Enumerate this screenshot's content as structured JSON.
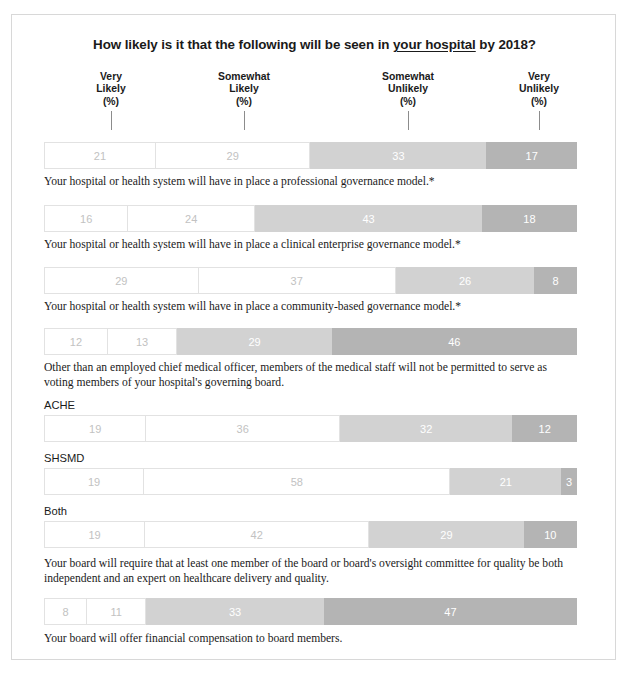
{
  "title": {
    "part1": "How likely is it that the following will be seen in ",
    "emphasis": "your hospital",
    "part2": " by 2018?"
  },
  "column_headers": [
    {
      "line1": "Very",
      "line2": "Likely",
      "line3": "(%)"
    },
    {
      "line1": "Somewhat",
      "line2": "Likely",
      "line3": "(%)"
    },
    {
      "line1": "Somewhat",
      "line2": "Unlikely",
      "line3": "(%)"
    },
    {
      "line1": "Very",
      "line2": "Unlikely",
      "line3": "(%)"
    }
  ],
  "series_labels": {
    "ache": "ACHE",
    "shsmd": "SHSMD",
    "both": "Both"
  },
  "captions": {
    "c1": "Your hospital or health system will have in place a professional governance model.*",
    "c2": "Your hospital or health system will have in place a clinical enterprise governance model.*",
    "c3": "Your hospital or health system will have in place a community-based governance model.*",
    "c4": "Other than an employed chief medical officer, members of the medical staff will not be permitted to serve as voting members of your hospital's governing board.",
    "c5": "Your board will require that at least one member of the board or board's oversight committee for quality be both independent and an expert on healthcare delivery and quality.",
    "c6": "Your board will offer financial compensation to board members."
  },
  "colors": {
    "very_likely": "#ffffff",
    "somewhat_likely": "#ffffff",
    "somewhat_unlikely": "#d2d2d2",
    "very_unlikely": "#b4b4b4",
    "segment_border": "#e2e2e2",
    "light_text": "#c2c2c2",
    "white_text": "#ffffff",
    "frame_border": "#d8d8d8",
    "leader_line": "#8c8c8c"
  },
  "chart_data": {
    "type": "bar",
    "title": "How likely is it that the following will be seen in your hospital by 2018?",
    "orientation": "horizontal-stacked",
    "xlabel": "",
    "ylabel": "",
    "xlim": [
      0,
      100
    ],
    "grid": false,
    "legend_position": "top",
    "categories": [
      "Very Likely (%)",
      "Somewhat Likely (%)",
      "Somewhat Unlikely (%)",
      "Very Unlikely (%)"
    ],
    "rows": [
      {
        "label": "Your hospital or health system will have in place a professional governance model.*",
        "series_label": "",
        "values": [
          21,
          29,
          33,
          17
        ]
      },
      {
        "label": "Your hospital or health system will have in place a clinical enterprise governance model.*",
        "series_label": "",
        "values": [
          16,
          24,
          43,
          18
        ]
      },
      {
        "label": "Your hospital or health system will have in place a community-based governance model.*",
        "series_label": "",
        "values": [
          29,
          37,
          26,
          8
        ]
      },
      {
        "label": "Other than an employed chief medical officer, members of the medical staff will not be permitted to serve as voting members of your hospital's governing board.",
        "series_label": "",
        "values": [
          12,
          13,
          29,
          46
        ]
      },
      {
        "label": "Your board will require that at least one member of the board or board's oversight committee for quality be both independent and an expert on healthcare delivery and quality.",
        "series_label": "ACHE",
        "values": [
          19,
          36,
          32,
          12
        ]
      },
      {
        "label": "",
        "series_label": "SHSMD",
        "values": [
          19,
          58,
          21,
          3
        ]
      },
      {
        "label": "",
        "series_label": "Both",
        "values": [
          19,
          42,
          29,
          10
        ]
      },
      {
        "label": "Your board will offer financial compensation to board members.",
        "series_label": "",
        "values": [
          8,
          11,
          33,
          47
        ]
      }
    ]
  },
  "layout": {
    "header_x": [
      99,
      232,
      396,
      527
    ],
    "row_bar_tops": [
      127,
      190,
      252,
      313,
      400,
      453,
      506,
      583
    ],
    "caption_tops": [
      160,
      223,
      285,
      346,
      542,
      617
    ],
    "series_label_tops": [
      384,
      437,
      490
    ]
  }
}
